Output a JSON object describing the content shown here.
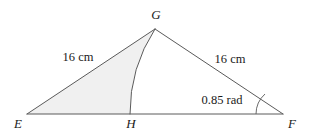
{
  "figure": {
    "type": "geometry-diagram",
    "background_color": "#ffffff",
    "stroke_color": "#5a5a5a",
    "shade_color": "#f0f0f0",
    "text_color": "#1a1a1a",
    "vertices": [
      {
        "id": "G",
        "label": "G",
        "x": 155,
        "y": 29,
        "label_x": 156,
        "label_y": 19,
        "anchor": "middle"
      },
      {
        "id": "E",
        "label": "E",
        "x": 27,
        "y": 114,
        "label_x": 18,
        "label_y": 128,
        "anchor": "middle"
      },
      {
        "id": "H",
        "label": "H",
        "x": 130,
        "y": 114,
        "label_x": 131,
        "label_y": 128,
        "anchor": "middle"
      },
      {
        "id": "F",
        "label": "F",
        "x": 283,
        "y": 114,
        "label_x": 292,
        "label_y": 128,
        "anchor": "middle"
      }
    ],
    "edges": [
      {
        "id": "EG",
        "from": "E",
        "to": "G"
      },
      {
        "id": "GF",
        "from": "G",
        "to": "F"
      },
      {
        "id": "EF",
        "from": "E",
        "to": "F"
      }
    ],
    "arc": {
      "id": "arc-GH",
      "centre": "E",
      "from": "G",
      "to": "H",
      "radius": 154,
      "path": "M 155 29 A 154 154 0 0 0 130 114"
    },
    "sector": {
      "id": "sector-EGH",
      "path": "M 27 114 L 155 29 A 154 154 0 0 0 130 114 Z",
      "fill": "#f0f0f0"
    },
    "measure_labels": [
      {
        "id": "eg-length",
        "text": "16 cm",
        "x": 78,
        "y": 61,
        "for_edge": "EG"
      },
      {
        "id": "gf-length",
        "text": "16 cm",
        "x": 230,
        "y": 63,
        "for_edge": "GF"
      },
      {
        "id": "angle-f",
        "text": "0.85 rad",
        "x": 222,
        "y": 104,
        "for_vertex": "F"
      }
    ],
    "angle_marks": [
      {
        "id": "angle-arc-F",
        "at_vertex": "F",
        "value": "0.85 rad",
        "radius": 27,
        "path": "M 256 114 A 27 27 0 0 1 265 94"
      }
    ]
  }
}
